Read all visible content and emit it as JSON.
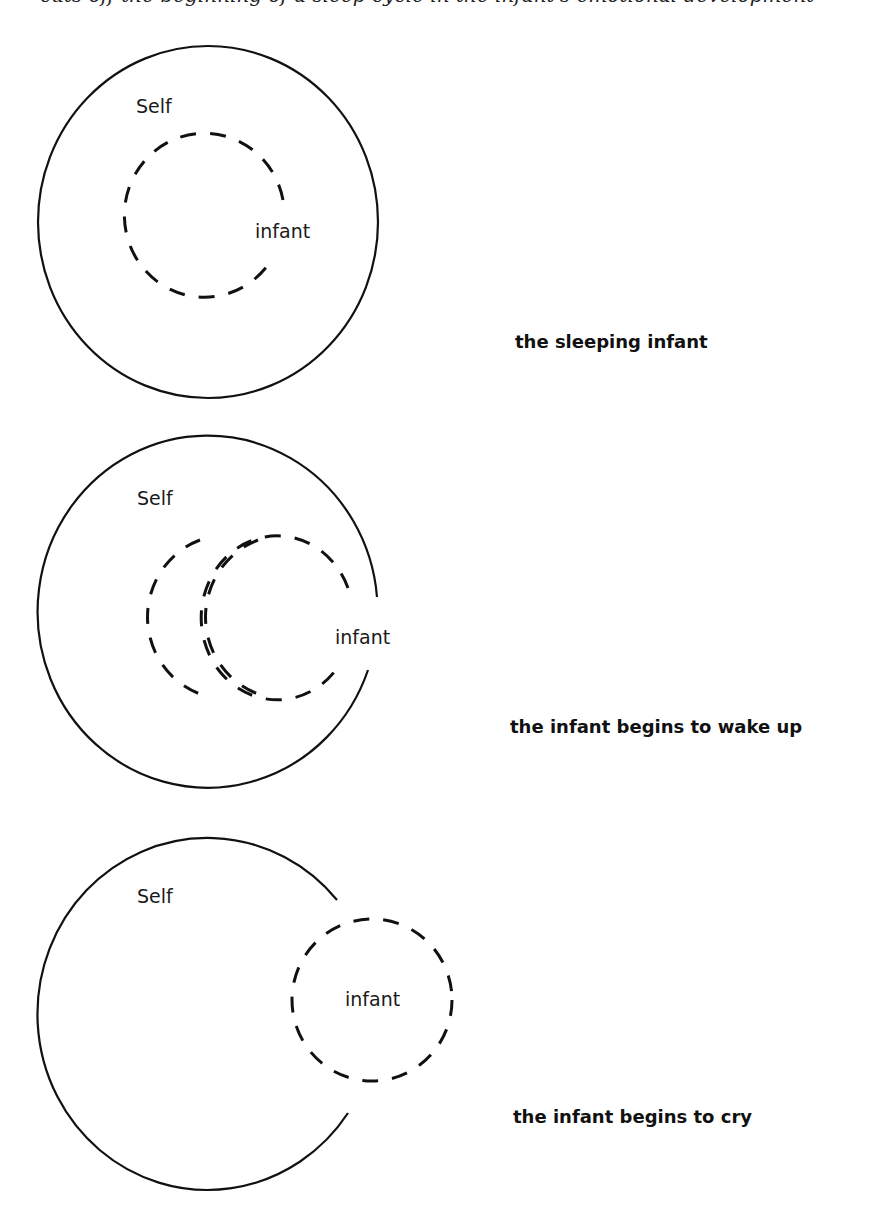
{
  "header_fragment": "cuts off the beginning of a sleep cycle in the infant's emotional development",
  "diagrams": [
    {
      "id": "sleeping",
      "outer_label": "Self",
      "inner_label": "infant",
      "caption": "the sleeping infant"
    },
    {
      "id": "waking",
      "outer_label": "Self",
      "inner_label": "infant",
      "caption": "the infant begins to wake up"
    },
    {
      "id": "crying",
      "outer_label": "Self",
      "inner_label": "infant",
      "caption": "the infant begins to cry"
    }
  ],
  "colors": {
    "stroke": "#111111",
    "background": "#ffffff"
  }
}
